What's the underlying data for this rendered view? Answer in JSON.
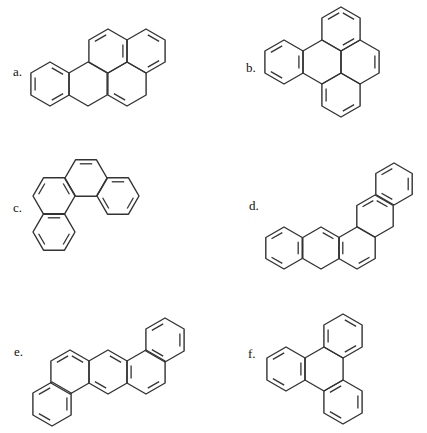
{
  "figure": {
    "stroke_color": "#333333",
    "background": "#ffffff",
    "molecules": [
      {
        "label": "a.",
        "label_pos": [
          13,
          64
        ],
        "orientation": "pointy",
        "r": 22,
        "rings": [
          {
            "c": [
              50,
              84
            ],
            "double": [
              0,
              2,
              4
            ]
          },
          {
            "c": [
              88,
              84
            ],
            "double": []
          },
          {
            "c": [
              127,
              84
            ],
            "double": [
              3
            ]
          },
          {
            "c": [
              108,
              51
            ],
            "double": [
              5,
              1
            ]
          },
          {
            "c": [
              146,
              51
            ],
            "double": [
              0,
              2
            ]
          }
        ]
      },
      {
        "label": "b.",
        "label_pos": [
          246,
          60
        ],
        "orientation": "pointy",
        "r": 22,
        "rings": [
          {
            "c": [
              284,
              62
            ],
            "double": [
              1,
              3,
              5
            ]
          },
          {
            "c": [
              322,
              62
            ],
            "double": []
          },
          {
            "c": [
              341,
              29
            ],
            "double": [
              0,
              2,
              5
            ]
          },
          {
            "c": [
              341,
              95
            ],
            "double": [
              2,
              4
            ]
          },
          {
            "c": [
              360,
              62
            ],
            "double": [
              1
            ]
          }
        ]
      },
      {
        "label": "c.",
        "label_pos": [
          13,
          200
        ],
        "orientation": "flat",
        "r": 21,
        "rings": [
          {
            "c": [
              86,
              178
            ],
            "double": [
              4
            ]
          },
          {
            "c": [
              118,
              196
            ],
            "double": [
              0,
              2,
              4
            ]
          },
          {
            "c": [
              54,
              196
            ],
            "double": [
              3,
              5
            ]
          },
          {
            "c": [
              54,
              232
            ],
            "double": [
              0,
              2,
              4
            ]
          }
        ]
      },
      {
        "label": "d.",
        "label_pos": [
          249,
          198
        ],
        "orientation": "pointy",
        "r": 21,
        "rings": [
          {
            "c": [
              284,
              248
            ],
            "double": [
              1,
              3,
              5
            ]
          },
          {
            "c": [
              321,
              248
            ],
            "double": [
              0
            ]
          },
          {
            "c": [
              357,
              248
            ],
            "double": [
              2,
              4
            ]
          },
          {
            "c": [
              375,
              216
            ],
            "double": [
              0,
              5
            ]
          },
          {
            "c": [
              394,
              184
            ],
            "double": [
              1,
              3,
              5
            ]
          }
        ]
      },
      {
        "label": "e.",
        "label_pos": [
          14,
          344
        ],
        "orientation": "pointy",
        "r": 22,
        "rings": [
          {
            "c": [
              52,
              404
            ],
            "double": [
              1,
              3,
              5
            ]
          },
          {
            "c": [
              70,
              372
            ],
            "double": [
              0,
              5
            ]
          },
          {
            "c": [
              108,
              372
            ],
            "double": [
              0,
              3
            ]
          },
          {
            "c": [
              146,
              372
            ],
            "double": [
              2,
              4
            ]
          },
          {
            "c": [
              165,
              340
            ],
            "double": [
              1,
              3,
              5
            ]
          }
        ]
      },
      {
        "label": "f.",
        "label_pos": [
          248,
          346
        ],
        "orientation": "pointy",
        "r": 22,
        "rings": [
          {
            "c": [
              286,
              369
            ],
            "double": [
              1,
              3,
              5
            ]
          },
          {
            "c": [
              324,
              369
            ],
            "double": []
          },
          {
            "c": [
              343,
              336
            ],
            "double": [
              0,
              2,
              4
            ]
          },
          {
            "c": [
              343,
              402
            ],
            "double": [
              1,
              3,
              5
            ]
          }
        ]
      }
    ]
  }
}
